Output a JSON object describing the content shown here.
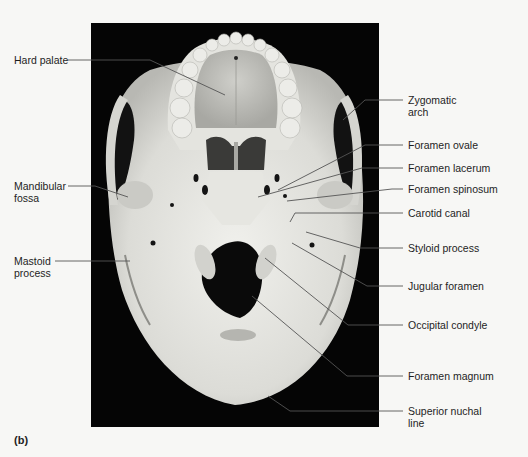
{
  "figure": {
    "panel_label": "(b)",
    "view": "Inferior view of skull",
    "colors": {
      "background": "#f7f7f5",
      "photo_background": "#050505",
      "bone_light": "#e8e8e4",
      "bone_mid": "#c9c9c4",
      "bone_shadow": "#8a8a86",
      "leader_line": "#555555",
      "text": "#1e1e1e"
    }
  },
  "labels_left": [
    {
      "id": "hard-palate",
      "line1": "Hard palate",
      "line2": ""
    },
    {
      "id": "mandibular-fossa",
      "line1": "Mandibular",
      "line2": "fossa"
    },
    {
      "id": "mastoid-process",
      "line1": "Mastoid",
      "line2": "process"
    }
  ],
  "labels_right": [
    {
      "id": "zygomatic-arch",
      "line1": "Zygomatic",
      "line2": "arch"
    },
    {
      "id": "foramen-ovale",
      "line1": "Foramen ovale",
      "line2": ""
    },
    {
      "id": "foramen-lacerum",
      "line1": "Foramen lacerum",
      "line2": ""
    },
    {
      "id": "foramen-spinosum",
      "line1": "Foramen spinosum",
      "line2": ""
    },
    {
      "id": "carotid-canal",
      "line1": "Carotid canal",
      "line2": ""
    },
    {
      "id": "styloid-process",
      "line1": "Styloid process",
      "line2": ""
    },
    {
      "id": "jugular-foramen",
      "line1": "Jugular foramen",
      "line2": ""
    },
    {
      "id": "occipital-condyle",
      "line1": "Occipital condyle",
      "line2": ""
    },
    {
      "id": "foramen-magnum",
      "line1": "Foramen magnum",
      "line2": ""
    },
    {
      "id": "superior-nuchal-line",
      "line1": "Superior nuchal",
      "line2": "line"
    }
  ]
}
